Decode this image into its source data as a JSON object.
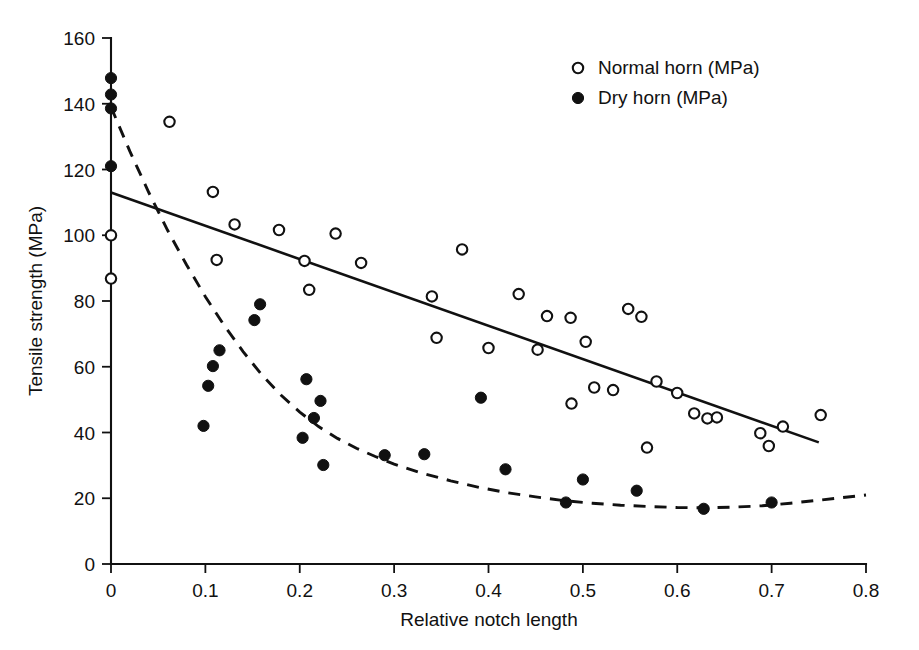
{
  "chart_data": {
    "type": "scatter",
    "title": "",
    "xlabel": "Relative notch length",
    "ylabel": "Tensile strength (MPa)",
    "xlim": [
      0,
      0.8
    ],
    "ylim": [
      0,
      160
    ],
    "xticks": [
      0,
      0.1,
      0.2,
      0.3,
      0.4,
      0.5,
      0.6,
      0.7,
      0.8
    ],
    "xticklabels": [
      "0",
      "0.1",
      "0.2",
      "0.3",
      "0.4",
      "0.5",
      "0.6",
      "0.7",
      "0.8"
    ],
    "yticks": [
      0,
      20,
      40,
      60,
      80,
      100,
      120,
      140,
      160
    ],
    "yticklabels": [
      "0",
      "20",
      "40",
      "60",
      "80",
      "100",
      "120",
      "140",
      "160"
    ],
    "grid": false,
    "legend_position": "top-right",
    "series": [
      {
        "name": "Normal horn (MPa)",
        "marker": "open-circle",
        "color": "#111111",
        "points": [
          [
            0.0,
            100.0
          ],
          [
            0.0,
            86.8
          ],
          [
            0.062,
            134.5
          ],
          [
            0.108,
            113.2
          ],
          [
            0.112,
            92.5
          ],
          [
            0.131,
            103.3
          ],
          [
            0.178,
            101.6
          ],
          [
            0.205,
            92.2
          ],
          [
            0.21,
            83.4
          ],
          [
            0.238,
            100.5
          ],
          [
            0.265,
            91.6
          ],
          [
            0.34,
            81.4
          ],
          [
            0.345,
            68.8
          ],
          [
            0.372,
            95.7
          ],
          [
            0.4,
            65.7
          ],
          [
            0.432,
            82.1
          ],
          [
            0.452,
            65.2
          ],
          [
            0.462,
            75.4
          ],
          [
            0.487,
            74.9
          ],
          [
            0.488,
            48.8
          ],
          [
            0.503,
            67.6
          ],
          [
            0.512,
            53.7
          ],
          [
            0.532,
            52.9
          ],
          [
            0.548,
            77.6
          ],
          [
            0.562,
            75.2
          ],
          [
            0.568,
            35.4
          ],
          [
            0.578,
            55.5
          ],
          [
            0.6,
            52.0
          ],
          [
            0.618,
            45.8
          ],
          [
            0.632,
            44.3
          ],
          [
            0.642,
            44.6
          ],
          [
            0.688,
            39.8
          ],
          [
            0.697,
            35.9
          ],
          [
            0.712,
            41.8
          ],
          [
            0.752,
            45.3
          ]
        ]
      },
      {
        "name": "Dry horn (MPa)",
        "marker": "filled-circle",
        "color": "#111111",
        "points": [
          [
            0.0,
            147.8
          ],
          [
            0.0,
            142.8
          ],
          [
            0.0,
            138.6
          ],
          [
            0.0,
            121.0
          ],
          [
            0.098,
            42.0
          ],
          [
            0.103,
            54.2
          ],
          [
            0.108,
            60.2
          ],
          [
            0.115,
            65.0
          ],
          [
            0.152,
            74.2
          ],
          [
            0.158,
            79.0
          ],
          [
            0.203,
            38.4
          ],
          [
            0.207,
            56.2
          ],
          [
            0.215,
            44.4
          ],
          [
            0.222,
            49.6
          ],
          [
            0.225,
            30.1
          ],
          [
            0.29,
            33.1
          ],
          [
            0.332,
            33.4
          ],
          [
            0.392,
            50.6
          ],
          [
            0.418,
            28.8
          ],
          [
            0.482,
            18.7
          ],
          [
            0.5,
            25.7
          ],
          [
            0.557,
            22.3
          ],
          [
            0.628,
            16.8
          ],
          [
            0.7,
            18.7
          ]
        ]
      }
    ],
    "fits": [
      {
        "name": "normal-horn-linear-fit",
        "style": "solid",
        "start": [
          0.0,
          113.0
        ],
        "end": [
          0.75,
          37.0
        ]
      },
      {
        "name": "dry-horn-curve-fit",
        "style": "dashed",
        "points": [
          [
            0.0,
            139.0
          ],
          [
            0.02,
            125.5
          ],
          [
            0.04,
            113.0
          ],
          [
            0.06,
            101.5
          ],
          [
            0.08,
            91.0
          ],
          [
            0.1,
            81.3
          ],
          [
            0.12,
            72.5
          ],
          [
            0.14,
            64.6
          ],
          [
            0.16,
            57.5
          ],
          [
            0.18,
            51.4
          ],
          [
            0.2,
            46.2
          ],
          [
            0.22,
            41.8
          ],
          [
            0.24,
            38.2
          ],
          [
            0.26,
            35.2
          ],
          [
            0.28,
            32.7
          ],
          [
            0.3,
            30.4
          ],
          [
            0.33,
            27.6
          ],
          [
            0.36,
            25.3
          ],
          [
            0.39,
            23.3
          ],
          [
            0.42,
            21.7
          ],
          [
            0.45,
            20.4
          ],
          [
            0.48,
            19.3
          ],
          [
            0.51,
            18.5
          ],
          [
            0.54,
            17.9
          ],
          [
            0.57,
            17.5
          ],
          [
            0.6,
            17.2
          ],
          [
            0.63,
            17.1
          ],
          [
            0.66,
            17.3
          ],
          [
            0.69,
            17.7
          ],
          [
            0.72,
            18.5
          ],
          [
            0.75,
            19.4
          ],
          [
            0.8,
            21.0
          ]
        ]
      }
    ],
    "legend": [
      {
        "label": "Normal horn (MPa)",
        "marker": "open-circle"
      },
      {
        "label": "Dry horn (MPa)",
        "marker": "filled-circle"
      }
    ]
  }
}
